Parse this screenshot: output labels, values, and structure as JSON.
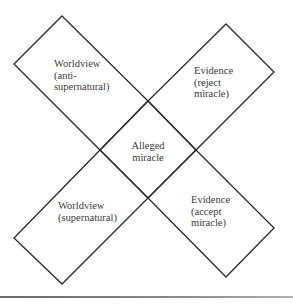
{
  "diagram": {
    "type": "crossed-rectangles",
    "stroke_color": "#2a2a2a",
    "text_color": "#3a3a3a",
    "center": {
      "label_line1": "Alleged",
      "label_line2": "miracle"
    },
    "boxes": [
      {
        "position": "top-left",
        "line1": "Worldview",
        "line2": "(anti-",
        "line3": "supernatural)"
      },
      {
        "position": "top-right",
        "line1": "Evidence",
        "line2": "(reject",
        "line3": "miracle)"
      },
      {
        "position": "bottom-left",
        "line1": "Worldview",
        "line2": "(supernatural)"
      },
      {
        "position": "bottom-right",
        "line1": "Evidence",
        "line2": "(accept",
        "line3": "miracle)"
      }
    ]
  }
}
